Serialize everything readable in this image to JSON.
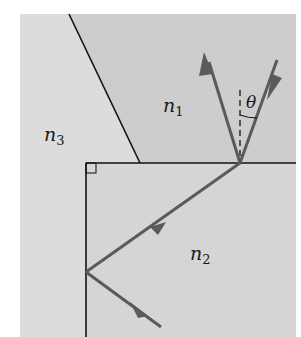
{
  "diagram": {
    "type": "optics-refraction",
    "media": [
      {
        "id": "n1",
        "label": "n",
        "subscript": "1"
      },
      {
        "id": "n2",
        "label": "n",
        "subscript": "2"
      },
      {
        "id": "n3",
        "label": "n",
        "subscript": "3"
      }
    ],
    "angle_label": "θ",
    "colors": {
      "background_region": "#d4d4d4",
      "region_n3": "#dadada",
      "region_n1": "#cfcfcf",
      "region_n2": "#d6d6d6",
      "boundary": "#111111",
      "ray": "#5a5a5a"
    }
  }
}
